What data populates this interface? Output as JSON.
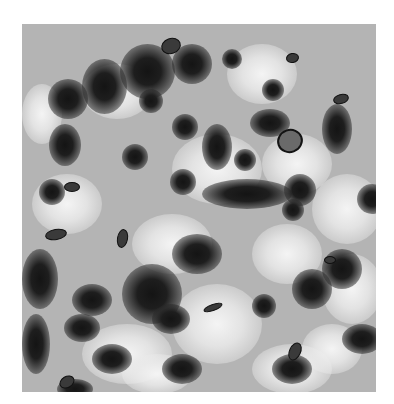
{
  "image": {
    "kind": "grayscale blurred noise texture",
    "colors": {
      "background": "#ffffff",
      "base_gray": "#b4b4b4",
      "dark_blob": "#141414",
      "light_patch": "#f4f4f4"
    },
    "light_patches": [
      [
        60,
        40,
        70,
        55
      ],
      [
        150,
        110,
        90,
        70
      ],
      [
        10,
        150,
        70,
        60
      ],
      [
        110,
        190,
        80,
        60
      ],
      [
        240,
        110,
        70,
        60
      ],
      [
        205,
        20,
        70,
        60
      ],
      [
        290,
        150,
        70,
        70
      ],
      [
        150,
        260,
        90,
        80
      ],
      [
        230,
        200,
        70,
        60
      ],
      [
        300,
        230,
        60,
        70
      ],
      [
        60,
        300,
        90,
        60
      ],
      [
        230,
        320,
        80,
        50
      ],
      [
        0,
        60,
        40,
        60
      ],
      [
        280,
        300,
        60,
        50
      ],
      [
        100,
        330,
        70,
        40
      ]
    ],
    "dark_blobs": [
      [
        98,
        20,
        55,
        55
      ],
      [
        60,
        35,
        45,
        55
      ],
      [
        150,
        20,
        40,
        40
      ],
      [
        26,
        55,
        40,
        40
      ],
      [
        117,
        65,
        24,
        24
      ],
      [
        150,
        90,
        26,
        26
      ],
      [
        27,
        100,
        32,
        42
      ],
      [
        100,
        120,
        26,
        26
      ],
      [
        148,
        145,
        26,
        26
      ],
      [
        17,
        155,
        26,
        26
      ],
      [
        200,
        25,
        20,
        20
      ],
      [
        240,
        55,
        22,
        22
      ],
      [
        228,
        85,
        40,
        28
      ],
      [
        300,
        80,
        30,
        50
      ],
      [
        180,
        100,
        30,
        46
      ],
      [
        212,
        125,
        22,
        22
      ],
      [
        180,
        155,
        90,
        30
      ],
      [
        262,
        150,
        32,
        32
      ],
      [
        335,
        160,
        30,
        30
      ],
      [
        260,
        175,
        22,
        22
      ],
      [
        150,
        210,
        50,
        40
      ],
      [
        100,
        240,
        60,
        60
      ],
      [
        130,
        280,
        38,
        30
      ],
      [
        50,
        260,
        40,
        32
      ],
      [
        0,
        225,
        36,
        60
      ],
      [
        0,
        290,
        28,
        60
      ],
      [
        42,
        290,
        36,
        28
      ],
      [
        70,
        320,
        40,
        30
      ],
      [
        300,
        225,
        40,
        40
      ],
      [
        355,
        265,
        24,
        24
      ],
      [
        270,
        245,
        40,
        40
      ],
      [
        230,
        270,
        24,
        24
      ],
      [
        320,
        300,
        40,
        30
      ],
      [
        250,
        330,
        40,
        30
      ],
      [
        140,
        330,
        40,
        30
      ],
      [
        35,
        355,
        36,
        20
      ]
    ],
    "specks": [
      [
        139,
        14,
        18,
        14,
        -20
      ],
      [
        42,
        158,
        14,
        8,
        0
      ],
      [
        23,
        205,
        20,
        9,
        -10
      ],
      [
        95,
        205,
        9,
        17,
        10
      ],
      [
        264,
        29,
        11,
        8,
        -10
      ],
      [
        311,
        70,
        14,
        8,
        -15
      ],
      [
        302,
        232,
        10,
        6,
        0
      ],
      [
        181,
        280,
        18,
        5,
        -20
      ],
      [
        267,
        318,
        10,
        17,
        25
      ],
      [
        37,
        352,
        14,
        10,
        -30
      ]
    ],
    "rings": [
      [
        255,
        105,
        22,
        20,
        -20
      ]
    ]
  }
}
